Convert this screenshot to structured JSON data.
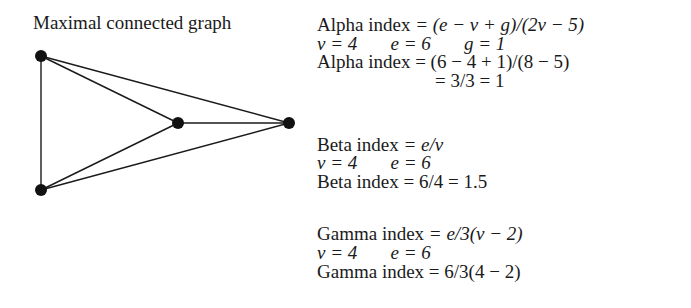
{
  "title": "Maximal connected graph",
  "graph": {
    "vertices": [
      {
        "id": "a",
        "x": 41,
        "y": 56
      },
      {
        "id": "b",
        "x": 178,
        "y": 123
      },
      {
        "id": "c",
        "x": 289,
        "y": 123
      },
      {
        "id": "d",
        "x": 41,
        "y": 190
      }
    ],
    "edges": [
      [
        "a",
        "d"
      ],
      [
        "a",
        "b"
      ],
      [
        "a",
        "c"
      ],
      [
        "b",
        "c"
      ],
      [
        "b",
        "d"
      ],
      [
        "c",
        "d"
      ]
    ],
    "vertex_count": 4,
    "edge_count": 6
  },
  "alpha": {
    "formula_label": "Alpha index",
    "formula": "= (e − v + g)/(2v − 5)",
    "vars": "v = 4       e = 6       g = 1",
    "calc_label": "Alpha index",
    "calc": "= (6 − 4 + 1)/(8 − 5)",
    "result": "= 3/3 = 1"
  },
  "beta": {
    "formula_label": "Beta index",
    "formula": "= e/v",
    "vars": "v = 4       e = 6",
    "calc_label": "Beta index",
    "calc": "= 6/4 = 1.5"
  },
  "gamma": {
    "formula_label": "Gamma index",
    "formula": "= e/3(v − 2)",
    "vars": "v = 4       e = 6",
    "calc_label": "Gamma index",
    "calc": "= 6/3(4 − 2)"
  }
}
